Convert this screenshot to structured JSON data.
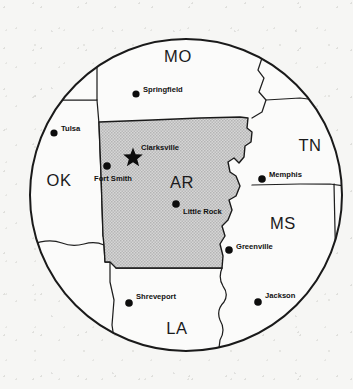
{
  "map": {
    "title": "Arkansas regional locator map",
    "frame": {
      "shape": "circle",
      "center_x": 186,
      "center_y": 195,
      "radius": 157,
      "stroke_color": "#1a1a1a"
    },
    "background_color": "#f6f6f4",
    "highlight": {
      "state_code": "AR",
      "fill_color": "#c9c9c9",
      "stroke_color": "#1a1a1a"
    },
    "states": [
      {
        "code": "MO",
        "name": "Missouri",
        "label_x": 178,
        "label_y": 62
      },
      {
        "code": "OK",
        "name": "Oklahoma",
        "label_x": 59,
        "label_y": 180
      },
      {
        "code": "TN",
        "name": "Tennessee",
        "label_x": 308,
        "label_y": 150
      },
      {
        "code": "AR",
        "name": "Arkansas",
        "label_x": 182,
        "label_y": 182
      },
      {
        "code": "MS",
        "name": "Mississippi",
        "label_x": 283,
        "label_y": 227
      },
      {
        "code": "LA",
        "name": "Louisiana",
        "label_x": 177,
        "label_y": 330
      }
    ],
    "cities": [
      {
        "name": "Springfield",
        "marker": "dot",
        "dot_x": 136,
        "dot_y": 94,
        "label_x": 143,
        "label_y": 90
      },
      {
        "name": "Tulsa",
        "marker": "dot",
        "dot_x": 54,
        "dot_y": 133,
        "label_x": 61,
        "label_y": 129
      },
      {
        "name": "Clarksville",
        "marker": "star",
        "dot_x": 133,
        "dot_y": 156,
        "label_x": 141,
        "label_y": 150
      },
      {
        "name": "Fort Smith",
        "marker": "dot",
        "dot_x": 107,
        "dot_y": 166,
        "label_x": 95,
        "label_y": 180
      },
      {
        "name": "Memphis",
        "marker": "dot",
        "dot_x": 262,
        "dot_y": 179,
        "label_x": 269,
        "label_y": 175
      },
      {
        "name": "Little Rock",
        "marker": "dot",
        "dot_x": 176,
        "dot_y": 204,
        "label_x": 183,
        "label_y": 213
      },
      {
        "name": "Greenville",
        "marker": "dot",
        "dot_x": 229,
        "dot_y": 250,
        "label_x": 236,
        "label_y": 248
      },
      {
        "name": "Shreveport",
        "marker": "dot",
        "dot_x": 129,
        "dot_y": 303,
        "label_x": 136,
        "label_y": 297
      },
      {
        "name": "Jackson",
        "marker": "dot",
        "dot_x": 258,
        "dot_y": 302,
        "label_x": 265,
        "label_y": 296
      }
    ]
  }
}
